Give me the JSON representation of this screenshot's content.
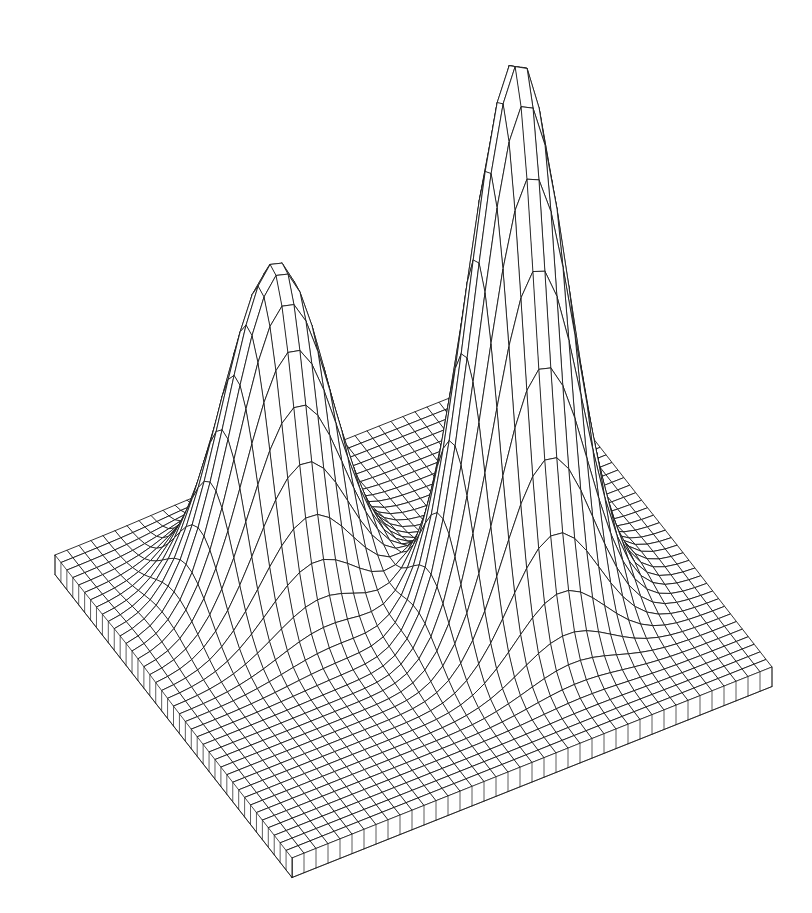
{
  "figure": {
    "kind": "3d-wireframe-surface-plot",
    "title": "",
    "subtitle": "",
    "background_color": "#ffffff",
    "line_color": "#1a1a1a",
    "line_width": 0.9,
    "canvas_width": 812,
    "canvas_height": 913
  },
  "chart_data": {
    "type": "line",
    "plot_style": "3d-wireframe-mesh",
    "title": "",
    "subtitle": "",
    "xlabel": "",
    "ylabel": "",
    "zlabel": "",
    "legend": [],
    "grid": true,
    "grid_color": "#1a1a1a",
    "legend_position": "none",
    "mesh": {
      "rows": 40,
      "cols": 40,
      "u_samples": 41,
      "v_samples": 41,
      "hidden_line_removal": true,
      "skirt": true,
      "skirt_depth": 0.035
    },
    "xlim": [
      -3,
      3
    ],
    "ylim": [
      -3,
      3
    ],
    "zlim": [
      0,
      1
    ],
    "surface_function": "z = 1.00*exp(-((x-0.95)^2/0.62 + (y+0.70)^2/0.62)) + 0.585*exp(-((x+1.15)^2/0.70 + (y-1.15)^2/0.70))",
    "peaks": [
      {
        "name": "tall-peak",
        "x": 0.95,
        "y": -0.7,
        "z": 1.0,
        "relative_height": 1.0,
        "pixel_apex": [
          510,
          58
        ]
      },
      {
        "name": "short-peak",
        "x": -1.15,
        "y": 1.15,
        "z": 0.585,
        "relative_height": 0.585,
        "pixel_apex": [
          200,
          352
        ]
      }
    ],
    "saddle": {
      "name": "valley-between-peaks",
      "approx_z": 0.17,
      "pixel_position": [
        352,
        455
      ]
    },
    "base_corners_pixels": {
      "left": [
        55,
        555
      ],
      "front": [
        292,
        858
      ],
      "right": [
        772,
        667
      ],
      "back": [
        535,
        398
      ]
    },
    "projection": {
      "type": "oblique-orthographic",
      "azimuth_deg": -37,
      "elevation_deg": 26,
      "scale": 1.0
    },
    "x": [
      -3,
      -2.25,
      -1.5,
      -0.75,
      0,
      0.75,
      1.5,
      2.25,
      3
    ],
    "series": [
      {
        "name": "z at y = -3.00",
        "values": [
          0.0,
          0.0,
          0.01,
          0.02,
          0.03,
          0.04,
          0.03,
          0.01,
          0.0
        ]
      },
      {
        "name": "z at y = -2.25",
        "values": [
          0.0,
          0.01,
          0.03,
          0.09,
          0.17,
          0.22,
          0.16,
          0.06,
          0.01
        ]
      },
      {
        "name": "z at y = -1.50",
        "values": [
          0.01,
          0.02,
          0.08,
          0.25,
          0.51,
          0.66,
          0.48,
          0.19,
          0.04
        ]
      },
      {
        "name": "z at y = -0.75",
        "values": [
          0.01,
          0.03,
          0.11,
          0.35,
          0.74,
          1.0,
          0.72,
          0.28,
          0.05
        ]
      },
      {
        "name": "z at y = 0.00",
        "values": [
          0.04,
          0.07,
          0.12,
          0.26,
          0.52,
          0.68,
          0.49,
          0.19,
          0.04
        ]
      },
      {
        "name": "z at y = 0.75",
        "values": [
          0.15,
          0.28,
          0.33,
          0.23,
          0.21,
          0.23,
          0.16,
          0.06,
          0.01
        ]
      },
      {
        "name": "z at y = 1.50",
        "values": [
          0.27,
          0.52,
          0.56,
          0.28,
          0.08,
          0.05,
          0.03,
          0.01,
          0.0
        ]
      },
      {
        "name": "z at y = 2.25",
        "values": [
          0.16,
          0.31,
          0.33,
          0.16,
          0.04,
          0.01,
          0.0,
          0.0,
          0.0
        ]
      },
      {
        "name": "z at y = 3.00",
        "values": [
          0.04,
          0.08,
          0.09,
          0.04,
          0.01,
          0.0,
          0.0,
          0.0,
          0.0
        ]
      }
    ],
    "annotations": []
  }
}
